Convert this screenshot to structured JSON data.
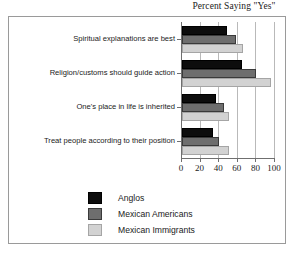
{
  "chart_data": {
    "type": "bar",
    "orientation": "horizontal",
    "title": "Percent Saying \"Yes\"",
    "xlabel": "",
    "ylabel": "",
    "xlim": [
      0,
      100
    ],
    "xticks": [
      0,
      20,
      40,
      60,
      80,
      100
    ],
    "xtick_labels": [
      "0",
      "20",
      "40",
      "60",
      "80",
      "100"
    ],
    "grid": true,
    "grid_axis": "x",
    "legend_position": "bottom-center",
    "categories": [
      "Spiritual explanations are best",
      "Religion/customs should guide action",
      "One's place in life is inherited",
      "Treat people according to their position"
    ],
    "series": [
      {
        "name": "Anglos",
        "color": "#0d0d0d",
        "values": [
          48,
          64,
          37,
          33
        ]
      },
      {
        "name": "Mexican Americans",
        "color": "#6e6e6e",
        "values": [
          58,
          80,
          45,
          40
        ]
      },
      {
        "name": "Mexican Immigrants",
        "color": "#d2d2d2",
        "values": [
          66,
          96,
          51,
          50
        ]
      }
    ]
  }
}
